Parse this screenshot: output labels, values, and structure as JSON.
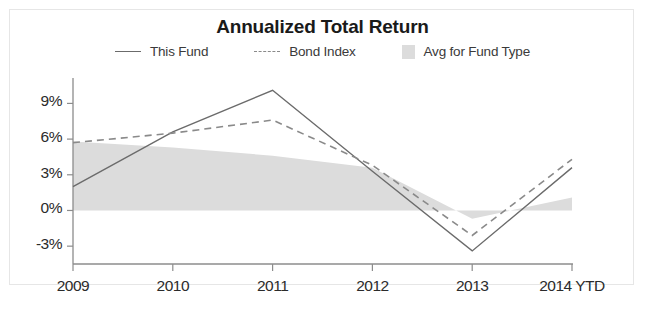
{
  "chart_data": {
    "type": "line",
    "title": "Annualized Total Return",
    "xlabel": "",
    "ylabel": "",
    "grid": false,
    "legend_position": "top-center",
    "categories": [
      "2009",
      "2010",
      "2011",
      "2012",
      "2013",
      "2014 YTD"
    ],
    "x_tick_labels": [
      "2009",
      "2010",
      "2011",
      "2012",
      "2013",
      "2014 YTD"
    ],
    "y_tick_labels": [
      "9%",
      "6%",
      "3%",
      "0%",
      "-3%"
    ],
    "y_tick_values": [
      9,
      6,
      3,
      0,
      -3
    ],
    "ylim": [
      -4.5,
      10.8
    ],
    "series": [
      {
        "name": "This Fund",
        "style": "solid",
        "color": "#6b6b6b",
        "values": [
          2.0,
          6.6,
          10.1,
          3.3,
          -3.4,
          3.6
        ]
      },
      {
        "name": "Bond Index",
        "style": "dashed",
        "color": "#8a8a8a",
        "values": [
          5.7,
          6.5,
          7.6,
          3.8,
          -2.1,
          4.3
        ]
      },
      {
        "name": "Avg for Fund Type",
        "style": "area",
        "color": "#dcdcdc",
        "values": [
          5.8,
          5.3,
          4.6,
          3.6,
          -0.7,
          1.1
        ]
      }
    ]
  },
  "legend": {
    "items": [
      {
        "label": "This Fund",
        "marker": "solid-line-swatch"
      },
      {
        "label": "Bond Index",
        "marker": "dashed-line-swatch"
      },
      {
        "label": "Avg for Fund Type",
        "marker": "area-fill-swatch"
      }
    ]
  },
  "colors": {
    "this_fund_line": "#6b6b6b",
    "bond_index_line": "#8a8a8a",
    "avg_fund_type_area": "#dcdcdc",
    "axis": "#8c8c8c",
    "text": "#2b2b2b",
    "background": "#ffffff"
  }
}
